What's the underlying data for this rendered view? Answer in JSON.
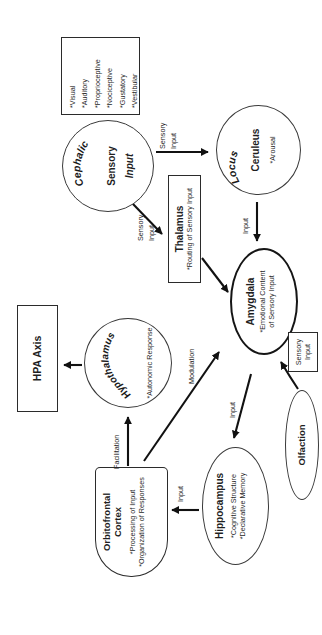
{
  "colors": {
    "ink": "#1f1f1f",
    "border": "#2b2b2b",
    "bg": "#ffffff"
  },
  "nodes": {
    "sensory_modalities": {
      "items": [
        "*Visual",
        "*Auditory",
        "*Proprioceptive",
        "*Nociceptive",
        "*Gustatory",
        "*Vestibular"
      ]
    },
    "cephalic": {
      "arched": "Cephalic",
      "line2": "Sensory",
      "line3": "Input"
    },
    "locus_ceruleus": {
      "arched": "Locus",
      "title": "Ceruleus",
      "sub": "*Arousal"
    },
    "thalamus": {
      "title": "Thalamus",
      "sub": "*Routing of Sensory Input"
    },
    "amygdala": {
      "title": "Amygdala",
      "sub1": "*Emotional Content",
      "sub2": "of Sensory Input"
    },
    "hpa_axis": {
      "title": "HPA Axis"
    },
    "hypothalamus": {
      "arched": "Hypothalamus",
      "sub": "*Autonomic Response"
    },
    "orbitofrontal": {
      "title1": "Orbitofrontal",
      "title2": "Cortex",
      "sub1": "*Processing of Input",
      "sub2": "*Organization of Responses"
    },
    "hippocampus": {
      "title": "Hippocampus",
      "sub1": "*Cognitive Structure",
      "sub2": "*Declarative Memory"
    },
    "olfaction": {
      "title": "Olfaction"
    },
    "olfaction_label_box": {
      "line1": "Sensory",
      "line2": "Input"
    }
  },
  "edge_labels": {
    "cephalic_locus_1": "Sensory",
    "cephalic_locus_2": "Input",
    "cephalic_thalamus_1": "Sensory",
    "cephalic_thalamus_2": "Input",
    "locus_amygdala": "Input",
    "ofc_amygdala": "Modulation",
    "ofc_hypothalamus": "Facilitation",
    "amygdala_hippocampus": "Input",
    "hippocampus_ofc": "Input"
  }
}
